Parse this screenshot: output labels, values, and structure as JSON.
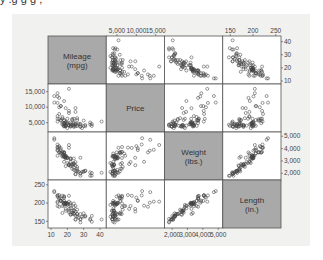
{
  "caption_partial": "y    .g    g  g    ,",
  "chart_data": {
    "type": "scatter",
    "subtype": "scatterplot-matrix",
    "title": "",
    "variables": [
      {
        "name": "mileage",
        "label_line1": "Mileage",
        "label_line2": "(mpg)",
        "range": [
          10,
          42
        ],
        "ticks": [
          10,
          20,
          30,
          40
        ],
        "tick_labels": [
          "10",
          "20",
          "30",
          "40"
        ],
        "axis_side": "bottom-left-right"
      },
      {
        "name": "price",
        "label_line1": "Price",
        "label_line2": "",
        "range": [
          3000,
          16500
        ],
        "ticks": [
          5000,
          10000,
          15000
        ],
        "tick_labels": [
          "5,000",
          "10,000",
          "15,000"
        ]
      },
      {
        "name": "weight",
        "label_line1": "Weight",
        "label_line2": "(lbs.)",
        "range": [
          1700,
          5100
        ],
        "ticks": [
          2000,
          3000,
          4000,
          5000
        ],
        "tick_labels": [
          "2,000",
          "3,000",
          "4,000",
          "5,000"
        ]
      },
      {
        "name": "length",
        "label_line1": "Length",
        "label_line2": "(in.)",
        "range": [
          140,
          255
        ],
        "ticks": [
          150,
          200,
          250
        ],
        "tick_labels": [
          "150",
          "200",
          "250"
        ]
      }
    ],
    "axes": {
      "top": {
        "columns": [
          1,
          3
        ]
      },
      "right": {
        "rows": [
          0,
          2
        ]
      },
      "left": {
        "rows": [
          1,
          3
        ]
      },
      "bottom": {
        "columns": [
          0,
          2
        ]
      }
    },
    "observations": [
      [
        22,
        4099,
        2930,
        186
      ],
      [
        17,
        4749,
        3350,
        173
      ],
      [
        22,
        3799,
        2640,
        168
      ],
      [
        20,
        4816,
        3250,
        196
      ],
      [
        15,
        7827,
        4080,
        222
      ],
      [
        18,
        5788,
        3670,
        218
      ],
      [
        26,
        4453,
        2230,
        170
      ],
      [
        20,
        5189,
        3280,
        200
      ],
      [
        16,
        10372,
        3880,
        207
      ],
      [
        19,
        4082,
        3400,
        200
      ],
      [
        14,
        11385,
        4330,
        221
      ],
      [
        14,
        14500,
        3900,
        204
      ],
      [
        21,
        15906,
        4290,
        204
      ],
      [
        29,
        3299,
        2110,
        163
      ],
      [
        16,
        5705,
        3690,
        212
      ],
      [
        22,
        4504,
        3180,
        193
      ],
      [
        22,
        5104,
        3220,
        200
      ],
      [
        24,
        3667,
        2750,
        179
      ],
      [
        19,
        3955,
        3430,
        197
      ],
      [
        30,
        3984,
        2120,
        163
      ],
      [
        18,
        4010,
        3600,
        206
      ],
      [
        16,
        5886,
        3600,
        206
      ],
      [
        17,
        6342,
        3740,
        220
      ],
      [
        28,
        4389,
        1800,
        147
      ],
      [
        21,
        4187,
        2650,
        179
      ],
      [
        12,
        11497,
        4840,
        233
      ],
      [
        12,
        13594,
        4720,
        230
      ],
      [
        14,
        13466,
        3830,
        201
      ],
      [
        22,
        3829,
        2580,
        169
      ],
      [
        14,
        5379,
        4060,
        221
      ],
      [
        15,
        6165,
        3720,
        212
      ],
      [
        18,
        4516,
        3370,
        198
      ],
      [
        14,
        6303,
        4130,
        217
      ],
      [
        20,
        3291,
        2830,
        195
      ],
      [
        21,
        8814,
        4060,
        220
      ],
      [
        19,
        5172,
        3310,
        198
      ],
      [
        19,
        4733,
        3300,
        198
      ],
      [
        18,
        4890,
        3690,
        218
      ],
      [
        19,
        4181,
        3370,
        200
      ],
      [
        24,
        4195,
        2730,
        180
      ],
      [
        16,
        10371,
        4030,
        206
      ],
      [
        28,
        4647,
        3260,
        170
      ],
      [
        34,
        4425,
        1800,
        157
      ],
      [
        25,
        4482,
        2200,
        165
      ],
      [
        26,
        6486,
        2520,
        182
      ],
      [
        18,
        4060,
        3330,
        201
      ],
      [
        18,
        5798,
        3700,
        214
      ],
      [
        18,
        4934,
        3470,
        198
      ],
      [
        19,
        5222,
        3210,
        201
      ],
      [
        24,
        4723,
        3200,
        199
      ],
      [
        17,
        4424,
        3420,
        203
      ],
      [
        23,
        4172,
        2690,
        179
      ],
      [
        19,
        9690,
        3260,
        184
      ],
      [
        24,
        6295,
        2830,
        189
      ],
      [
        25,
        9735,
        2650,
        177
      ],
      [
        23,
        6229,
        2370,
        170
      ],
      [
        35,
        4589,
        2020,
        165
      ],
      [
        24,
        5079,
        2280,
        170
      ],
      [
        21,
        8129,
        2750,
        184
      ],
      [
        41,
        5397,
        2040,
        155
      ],
      [
        25,
        4697,
        1930,
        155
      ],
      [
        28,
        3748,
        1990,
        156
      ],
      [
        30,
        5719,
        2160,
        172
      ],
      [
        14,
        7140,
        3420,
        192
      ],
      [
        26,
        5899,
        2370,
        170
      ],
      [
        35,
        3995,
        1800,
        149
      ],
      [
        18,
        11995,
        2930,
        193
      ],
      [
        31,
        3895,
        2200,
        165
      ],
      [
        18,
        3798,
        3350,
        200
      ],
      [
        23,
        5899,
        2750,
        174
      ],
      [
        25,
        3895,
        1930,
        155
      ],
      [
        28,
        3748,
        1990,
        156
      ],
      [
        17,
        6850,
        3590,
        192
      ],
      [
        21,
        4296,
        2670,
        175
      ],
      [
        19,
        3829,
        2580,
        179
      ],
      [
        22,
        4499,
        3120,
        196
      ],
      [
        24,
        4010,
        2450,
        172
      ],
      [
        26,
        3955,
        2160,
        164
      ],
      [
        15,
        12990,
        3690,
        190
      ],
      [
        20,
        6295,
        3240,
        199
      ],
      [
        31,
        4296,
        2200,
        163
      ],
      [
        34,
        5079,
        2070,
        154
      ],
      [
        27,
        4697,
        2120,
        160
      ],
      [
        25,
        8499,
        2910,
        192
      ],
      [
        15,
        10000,
        4200,
        215
      ]
    ]
  }
}
